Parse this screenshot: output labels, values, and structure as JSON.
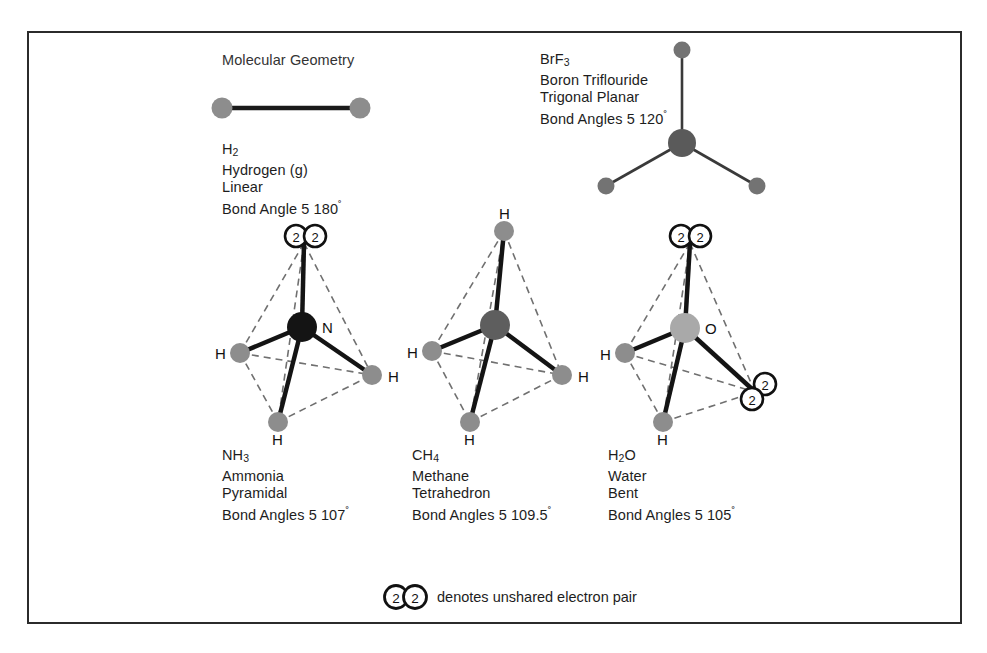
{
  "title": "Molecular Geometry",
  "molecules": [
    {
      "id": "h2",
      "formula_main": "H",
      "formula_sub": "2",
      "name": "Hydrogen (g)",
      "shape": "Linear",
      "bond_angle": "Bond Angle 5 180",
      "degree_mark": "˚",
      "atom_labels": []
    },
    {
      "id": "brf3",
      "formula_main": "BrF",
      "formula_sub": "3",
      "name": "Boron Triflouride",
      "shape": "Trigonal Planar",
      "bond_angle": "Bond Angles 5 120",
      "degree_mark": "˚",
      "atom_labels": []
    },
    {
      "id": "nh3",
      "formula_main": "NH",
      "formula_sub": "3",
      "name": "Ammonia",
      "shape": "Pyramidal",
      "bond_angle": "Bond Angles 5 107",
      "degree_mark": "˚",
      "center_label": "N",
      "atom_labels": [
        "H",
        "H",
        "H"
      ]
    },
    {
      "id": "ch4",
      "formula_main": "CH",
      "formula_sub": "4",
      "name": "Methane",
      "shape": "Tetrahedron",
      "bond_angle": "Bond Angles 5 109.5",
      "degree_mark": "˚",
      "center_label": "",
      "atom_labels": [
        "H",
        "H",
        "H",
        "H"
      ]
    },
    {
      "id": "h2o",
      "formula_main": "H",
      "formula_sub": "2",
      "formula_tail": "O",
      "name": "Water",
      "shape": "Bent",
      "bond_angle": "Bond Angles 5 105",
      "degree_mark": "˚",
      "center_label": "O",
      "atom_labels": [
        "H",
        "H"
      ]
    }
  ],
  "labels": {
    "h2_formula_main": "H",
    "h2_formula_sub": "2",
    "h2_name": "Hydrogen (g)",
    "h2_shape": "Linear",
    "h2_angle": "Bond Angle 5 180",
    "brf3_formula_main": "BrF",
    "brf3_formula_sub": "3",
    "brf3_name": "Boron Triflouride",
    "brf3_shape": "Trigonal Planar",
    "brf3_angle": "Bond Angles 5 120",
    "nh3_formula_main": "NH",
    "nh3_formula_sub": "3",
    "nh3_name": "Ammonia",
    "nh3_shape": "Pyramidal",
    "nh3_angle": "Bond Angles 5 107",
    "ch4_formula_main": "CH",
    "ch4_formula_sub": "4",
    "ch4_name": "Methane",
    "ch4_shape": "Tetrahedron",
    "ch4_angle": "Bond Angles 5 109.5",
    "h2o_formula_main": "H",
    "h2o_formula_sub": "2",
    "h2o_formula_tail": "O",
    "h2o_name": "Water",
    "h2o_shape": "Bent",
    "h2o_angle": "Bond Angles 5 105",
    "nitrogen": "N",
    "oxygen": "O",
    "hydrogen": "H",
    "degree": "˚",
    "electron_pair_digit": "2"
  },
  "legend": {
    "text": "denotes unshared electron pair",
    "digit": "2"
  },
  "colors": {
    "frame": "#2b2b2b",
    "bond": "#1a1a1a",
    "dashed_bond": "#6e6e6e",
    "atom_hydrogen": "#8d8d8d",
    "atom_nitrogen": "#141414",
    "atom_carbon": "#5e5e5e",
    "atom_oxygen": "#a9a9a9",
    "atom_fluorine": "#737373",
    "atom_boron": "#5a5a5a",
    "text": "#1d1d1d",
    "background": "#ffffff"
  }
}
